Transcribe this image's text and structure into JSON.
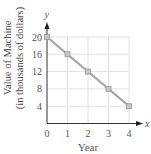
{
  "chart_data": {
    "type": "line",
    "title": "",
    "xlabel": "Year",
    "ylabel": "Value of Machine (in thousands of dollars)",
    "ylabel_lines": [
      "Value of Machine",
      "(in thousands of dollars)"
    ],
    "x_axis_symbol": "x",
    "y_axis_symbol": "y",
    "x": [
      0,
      1,
      2,
      3,
      4
    ],
    "series": [
      {
        "name": "Value of Machine",
        "values": [
          20,
          16,
          12,
          8,
          4
        ]
      }
    ],
    "x_ticks": [
      0,
      1,
      2,
      3,
      4
    ],
    "y_ticks": [
      4,
      8,
      12,
      16,
      20
    ],
    "xlim": [
      0,
      4
    ],
    "ylim": [
      0,
      20
    ],
    "grid": true,
    "legend": "none",
    "colors": {
      "line": "#a8a8a8",
      "marker": "#9a9a9a",
      "grid": "#e2e2e2",
      "axis": "#333333"
    }
  }
}
